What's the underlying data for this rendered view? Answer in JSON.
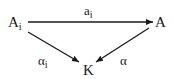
{
  "diagram": {
    "type": "commutative-triangle",
    "nodes": {
      "source": {
        "base": "A",
        "sub": "i"
      },
      "target": {
        "base": "A",
        "sub": ""
      },
      "bottom": {
        "base": "K",
        "sub": ""
      }
    },
    "edges": {
      "top": {
        "from": "A_i",
        "to": "A",
        "label_base": "a",
        "label_sub": "i"
      },
      "left": {
        "from": "A_i",
        "to": "K",
        "label_base": "α",
        "label_sub": "i"
      },
      "right": {
        "from": "A",
        "to": "K",
        "label_base": "α",
        "label_sub": ""
      }
    },
    "colors": {
      "ink": "#1a1a1a",
      "background": "#ffffff"
    }
  }
}
